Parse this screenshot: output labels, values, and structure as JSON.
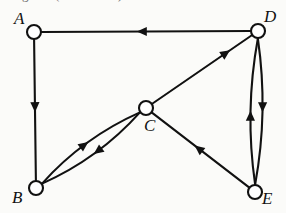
{
  "figure": {
    "caption_clipped": "diagram.  (Section 4.6)",
    "width": 286,
    "height": 213,
    "background_color": "#fbfbf9",
    "ink_color": "#111111",
    "node_fill_color": "#ffffff"
  },
  "chart_data": {
    "type": "diagram",
    "diagram_kind": "directed-graph",
    "title": "",
    "nodes": [
      {
        "id": "A",
        "label": "A",
        "cx": 34,
        "cy": 32,
        "r": 7,
        "label_x": 14,
        "label_y": 10
      },
      {
        "id": "D",
        "label": "D",
        "cx": 258,
        "cy": 31,
        "r": 7,
        "label_x": 264,
        "label_y": 8
      },
      {
        "id": "C",
        "label": "C",
        "cx": 146,
        "cy": 108,
        "r": 7,
        "label_x": 144,
        "label_y": 117
      },
      {
        "id": "B",
        "label": "B",
        "cx": 36,
        "cy": 188,
        "r": 7,
        "label_x": 12,
        "label_y": 189
      },
      {
        "id": "E",
        "label": "E",
        "cx": 255,
        "cy": 192,
        "r": 7,
        "label_x": 262,
        "label_y": 190
      }
    ],
    "edges": [
      {
        "from": "D",
        "to": "A",
        "shape": "straight",
        "arrow_at": 0.52,
        "description": "top horizontal edge, arrow pointing left toward A"
      },
      {
        "from": "A",
        "to": "B",
        "shape": "straight",
        "arrow_at": 0.48,
        "description": "left vertical edge, arrow pointing down toward B"
      },
      {
        "from": "C",
        "to": "D",
        "shape": "straight",
        "arrow_at": 0.74,
        "description": "diagonal edge, arrow pointing up-right toward D"
      },
      {
        "from": "E",
        "to": "C",
        "shape": "straight",
        "arrow_at": 0.52,
        "description": "diagonal edge, arrow pointing up-left toward C"
      },
      {
        "from": "B",
        "to": "C",
        "shape": "curve",
        "bow": -13,
        "arrow_at": 0.47,
        "description": "upper bowed curve, arrow pointing up-right toward C"
      },
      {
        "from": "C",
        "to": "B",
        "shape": "curve",
        "bow": -13,
        "arrow_at": 0.47,
        "description": "lower bowed curve, arrow pointing down-left toward B"
      },
      {
        "from": "E",
        "to": "D",
        "shape": "curve",
        "bow": -12,
        "arrow_at": 0.47,
        "description": "left bowed curve, arrow pointing up toward D"
      },
      {
        "from": "D",
        "to": "E",
        "shape": "curve",
        "bow": -12,
        "arrow_at": 0.47,
        "description": "right bowed curve, arrow pointing down toward E"
      }
    ],
    "legend": [],
    "annotations": []
  }
}
